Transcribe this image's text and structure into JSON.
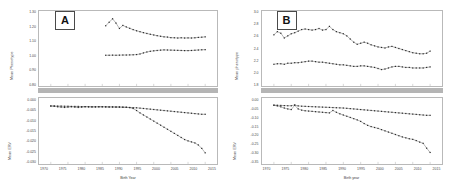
{
  "figure": {
    "panels": [
      {
        "label": "A",
        "xlabel": "Birth Year",
        "xticks": [
          "1970",
          "1975",
          "1980",
          "1985",
          "1990",
          "1995",
          "2000",
          "2005",
          "2010",
          "2015"
        ],
        "top": {
          "ylabel": "Mean Phenotype",
          "yticks": [
            "1.30",
            "1.20",
            "1.10",
            "1.00",
            "0.90",
            "0.80"
          ]
        },
        "bottom": {
          "ylabel": "Mean ERV",
          "yticks": [
            "0.000",
            "-0.005",
            "-0.010",
            "-0.015",
            "-0.020",
            "-0.025",
            "-0.030"
          ]
        }
      },
      {
        "label": "B",
        "xlabel": "Birth year",
        "xticks": [
          "1970",
          "1975",
          "1980",
          "1985",
          "1990",
          "1995",
          "2000",
          "2005",
          "2010",
          "2015"
        ],
        "top": {
          "ylabel": "Mean phenotype",
          "yticks": [
            "3.0",
            "2.8",
            "2.6",
            "2.4",
            "2.2",
            "2.0",
            "1.8"
          ]
        },
        "bottom": {
          "ylabel": "Mean ERV",
          "yticks": [
            "0.00",
            "-0.05",
            "-0.10",
            "-0.15",
            "-0.20",
            "-0.25",
            "-0.30",
            "-0.35"
          ]
        }
      }
    ]
  },
  "chart_data": [
    {
      "type": "line",
      "panel": "A",
      "subplot": "top",
      "title": "A - Mean Phenotype by Birth Year",
      "xlabel": "Birth Year",
      "ylabel": "Mean Phenotype",
      "xlim": [
        1968,
        2017
      ],
      "ylim": [
        0.78,
        1.34
      ],
      "grid": false,
      "legend": "none",
      "marker": "dotted-square",
      "series": [
        {
          "name": "upper series",
          "x": [
            1986,
            1987,
            1988,
            1989,
            1990,
            1991,
            1992,
            1993,
            1994,
            1995,
            1996,
            1997,
            1998,
            1999,
            2000,
            2001,
            2002,
            2003,
            2004,
            2005,
            2006,
            2007,
            2008,
            2009,
            2010,
            2011,
            2012,
            2013,
            2014,
            2015
          ],
          "y": [
            1.255,
            1.285,
            1.315,
            1.278,
            1.232,
            1.258,
            1.245,
            1.233,
            1.222,
            1.212,
            1.204,
            1.196,
            1.189,
            1.182,
            1.176,
            1.17,
            1.165,
            1.16,
            1.158,
            1.153,
            1.152,
            1.15,
            1.152,
            1.15,
            1.151,
            1.15,
            1.152,
            1.155,
            1.157,
            1.16
          ]
        },
        {
          "name": "lower series",
          "x": [
            1986,
            1987,
            1988,
            1989,
            1990,
            1991,
            1992,
            1993,
            1994,
            1995,
            1996,
            1997,
            1998,
            1999,
            2000,
            2001,
            2002,
            2003,
            2004,
            2005,
            2006,
            2007,
            2008,
            2009,
            2010,
            2011,
            2012,
            2013,
            2014,
            2015
          ],
          "y": [
            1.002,
            1.002,
            1.003,
            1.002,
            1.003,
            1.004,
            1.004,
            1.005,
            1.006,
            1.008,
            1.013,
            1.022,
            1.03,
            1.036,
            1.04,
            1.043,
            1.046,
            1.048,
            1.047,
            1.046,
            1.045,
            1.044,
            1.043,
            1.042,
            1.042,
            1.043,
            1.045,
            1.047,
            1.049,
            1.05
          ]
        }
      ]
    },
    {
      "type": "line",
      "panel": "A",
      "subplot": "bottom",
      "title": "A - Mean ERV by Birth Year",
      "xlabel": "Birth Year",
      "ylabel": "Mean ERV",
      "xlim": [
        1968,
        2017
      ],
      "ylim": [
        -0.0315,
        0.0015
      ],
      "grid": false,
      "legend": "none",
      "marker": "dotted-square",
      "series": [
        {
          "name": "upper series",
          "x": [
            1970,
            1971,
            1972,
            1973,
            1974,
            1975,
            1976,
            1977,
            1978,
            1979,
            1980,
            1981,
            1982,
            1983,
            1984,
            1985,
            1986,
            1987,
            1988,
            1989,
            1990,
            1991,
            1992,
            1993,
            1994,
            1995,
            1996,
            1997,
            1998,
            1999,
            2000,
            2001,
            2002,
            2003,
            2004,
            2005,
            2006,
            2007,
            2008,
            2009,
            2010,
            2011,
            2012,
            2013,
            2014,
            2015
          ],
          "y": [
            -0.0003,
            -0.0003,
            -0.0004,
            -0.0004,
            -0.0005,
            -0.0005,
            -0.0006,
            -0.0006,
            -0.0006,
            -0.0007,
            -0.0007,
            -0.0007,
            -0.0007,
            -0.0008,
            -0.0008,
            -0.0008,
            -0.0009,
            -0.0009,
            -0.0009,
            -0.001,
            -0.001,
            -0.0011,
            -0.0011,
            -0.0012,
            -0.0013,
            -0.0014,
            -0.0016,
            -0.0018,
            -0.002,
            -0.0022,
            -0.0024,
            -0.0026,
            -0.0028,
            -0.003,
            -0.0032,
            -0.0034,
            -0.0036,
            -0.0038,
            -0.004,
            -0.0042,
            -0.0044,
            -0.0046,
            -0.0048,
            -0.005,
            -0.0052,
            -0.0052
          ]
        },
        {
          "name": "lower series",
          "x": [
            1970,
            1971,
            1972,
            1973,
            1974,
            1975,
            1976,
            1977,
            1978,
            1979,
            1980,
            1981,
            1982,
            1983,
            1984,
            1985,
            1986,
            1987,
            1988,
            1989,
            1990,
            1991,
            1992,
            1993,
            1994,
            1995,
            1996,
            1997,
            1998,
            1999,
            2000,
            2001,
            2002,
            2003,
            2004,
            2005,
            2006,
            2007,
            2008,
            2009,
            2010,
            2011,
            2012,
            2013,
            2014,
            2015
          ],
          "y": [
            -0.0004,
            -0.0005,
            -0.0008,
            -0.001,
            -0.0012,
            -0.001,
            -0.0008,
            -0.001,
            -0.0012,
            -0.001,
            -0.0008,
            -0.0009,
            -0.001,
            -0.0009,
            -0.0008,
            -0.0008,
            -0.0008,
            -0.0009,
            -0.0009,
            -0.0009,
            -0.0009,
            -0.001,
            -0.0011,
            -0.0013,
            -0.0018,
            -0.003,
            -0.0044,
            -0.0056,
            -0.0068,
            -0.008,
            -0.0092,
            -0.0104,
            -0.0116,
            -0.0128,
            -0.014,
            -0.0152,
            -0.0164,
            -0.0176,
            -0.0188,
            -0.02,
            -0.0208,
            -0.0214,
            -0.022,
            -0.0232,
            -0.0252,
            -0.0278
          ]
        }
      ]
    },
    {
      "type": "line",
      "panel": "B",
      "subplot": "top",
      "title": "B - Mean phenotype by Birth year",
      "xlabel": "Birth year",
      "ylabel": "Mean phenotype",
      "xlim": [
        1968,
        2017
      ],
      "ylim": [
        1.78,
        3.02
      ],
      "grid": false,
      "legend": "none",
      "marker": "dotted-square",
      "series": [
        {
          "name": "upper series",
          "x": [
            1970,
            1971,
            1972,
            1973,
            1974,
            1975,
            1976,
            1977,
            1978,
            1979,
            1980,
            1981,
            1982,
            1983,
            1984,
            1985,
            1986,
            1987,
            1988,
            1989,
            1990,
            1991,
            1992,
            1993,
            1994,
            1995,
            1996,
            1997,
            1998,
            1999,
            2000,
            2001,
            2002,
            2003,
            2004,
            2005,
            2006,
            2007,
            2008,
            2009,
            2010,
            2011,
            2012,
            2013,
            2014,
            2015
          ],
          "y": [
            2.66,
            2.72,
            2.69,
            2.6,
            2.64,
            2.68,
            2.7,
            2.73,
            2.76,
            2.77,
            2.76,
            2.75,
            2.76,
            2.78,
            2.75,
            2.76,
            2.82,
            2.76,
            2.72,
            2.7,
            2.68,
            2.64,
            2.58,
            2.52,
            2.48,
            2.5,
            2.52,
            2.5,
            2.47,
            2.45,
            2.43,
            2.42,
            2.41,
            2.43,
            2.44,
            2.42,
            2.4,
            2.38,
            2.36,
            2.34,
            2.32,
            2.31,
            2.3,
            2.3,
            2.31,
            2.35
          ]
        },
        {
          "name": "lower series",
          "x": [
            1970,
            1971,
            1972,
            1973,
            1974,
            1975,
            1976,
            1977,
            1978,
            1979,
            1980,
            1981,
            1982,
            1983,
            1984,
            1985,
            1986,
            1987,
            1988,
            1989,
            1990,
            1991,
            1992,
            1993,
            1994,
            1995,
            1996,
            1997,
            1998,
            1999,
            2000,
            2001,
            2002,
            2003,
            2004,
            2005,
            2006,
            2007,
            2008,
            2009,
            2010,
            2011,
            2012,
            2013,
            2014,
            2015
          ],
          "y": [
            2.1,
            2.11,
            2.11,
            2.1,
            2.12,
            2.12,
            2.13,
            2.13,
            2.14,
            2.15,
            2.16,
            2.16,
            2.15,
            2.14,
            2.14,
            2.13,
            2.12,
            2.11,
            2.1,
            2.09,
            2.09,
            2.08,
            2.07,
            2.06,
            2.06,
            2.07,
            2.07,
            2.06,
            2.05,
            2.04,
            2.02,
            2.0,
            2.01,
            2.03,
            2.05,
            2.06,
            2.06,
            2.05,
            2.04,
            2.04,
            2.03,
            2.03,
            2.03,
            2.03,
            2.04,
            2.05
          ]
        }
      ]
    },
    {
      "type": "line",
      "panel": "B",
      "subplot": "bottom",
      "title": "B - Mean ERV by Birth year",
      "xlabel": "Birth year",
      "ylabel": "Mean ERV",
      "xlim": [
        1968,
        2017
      ],
      "ylim": [
        -0.36,
        0.01
      ],
      "grid": false,
      "legend": "none",
      "marker": "dotted-square",
      "series": [
        {
          "name": "upper series",
          "x": [
            1970,
            1971,
            1972,
            1973,
            1974,
            1975,
            1976,
            1977,
            1978,
            1979,
            1980,
            1981,
            1982,
            1983,
            1984,
            1985,
            1986,
            1987,
            1988,
            1989,
            1990,
            1991,
            1992,
            1993,
            1994,
            1995,
            1996,
            1997,
            1998,
            1999,
            2000,
            2001,
            2002,
            2003,
            2004,
            2005,
            2006,
            2007,
            2008,
            2009,
            2010,
            2011,
            2012,
            2013,
            2014,
            2015
          ],
          "y": [
            -0.005,
            -0.006,
            -0.007,
            -0.008,
            -0.009,
            -0.009,
            -0.004,
            -0.01,
            -0.012,
            -0.013,
            -0.014,
            -0.015,
            -0.016,
            -0.017,
            -0.018,
            -0.019,
            -0.02,
            -0.021,
            -0.022,
            -0.023,
            -0.024,
            -0.026,
            -0.028,
            -0.03,
            -0.032,
            -0.034,
            -0.036,
            -0.038,
            -0.04,
            -0.042,
            -0.044,
            -0.046,
            -0.048,
            -0.05,
            -0.052,
            -0.054,
            -0.056,
            -0.058,
            -0.06,
            -0.062,
            -0.064,
            -0.066,
            -0.068,
            -0.07,
            -0.072,
            -0.072
          ]
        },
        {
          "name": "lower series",
          "x": [
            1970,
            1971,
            1972,
            1973,
            1974,
            1975,
            1976,
            1977,
            1978,
            1979,
            1980,
            1981,
            1982,
            1983,
            1984,
            1985,
            1986,
            1987,
            1988,
            1989,
            1990,
            1991,
            1992,
            1993,
            1994,
            1995,
            1996,
            1997,
            1998,
            1999,
            2000,
            2001,
            2002,
            2003,
            2004,
            2005,
            2006,
            2007,
            2008,
            2009,
            2010,
            2011,
            2012,
            2013,
            2014,
            2015
          ],
          "y": [
            -0.006,
            -0.01,
            -0.016,
            -0.024,
            -0.03,
            -0.034,
            -0.006,
            -0.03,
            -0.038,
            -0.042,
            -0.044,
            -0.046,
            -0.048,
            -0.05,
            -0.052,
            -0.054,
            -0.056,
            -0.04,
            -0.052,
            -0.062,
            -0.07,
            -0.078,
            -0.086,
            -0.094,
            -0.102,
            -0.112,
            -0.126,
            -0.138,
            -0.146,
            -0.152,
            -0.158,
            -0.166,
            -0.174,
            -0.182,
            -0.19,
            -0.198,
            -0.206,
            -0.214,
            -0.22,
            -0.226,
            -0.23,
            -0.238,
            -0.248,
            -0.256,
            -0.288,
            -0.316
          ]
        }
      ]
    }
  ]
}
